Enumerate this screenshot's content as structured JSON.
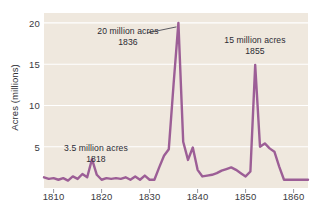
{
  "chart_data": {
    "type": "line",
    "title": "",
    "xlabel": "",
    "ylabel": "Acres (millions)",
    "xlim": [
      1808,
      1863
    ],
    "ylim": [
      0,
      21.2
    ],
    "grid": true,
    "legend": "none",
    "plot_background": "#efe8de",
    "line_color": "#9c5e96",
    "gridline_color": "#ffffff",
    "x_ticks": [
      1810,
      1820,
      1830,
      1840,
      1850,
      1860
    ],
    "x_tick_labels": [
      "1810",
      "1820",
      "1830",
      "1840",
      "1850",
      "1860"
    ],
    "y_ticks": [
      5,
      10,
      15,
      20
    ],
    "y_tick_labels": [
      "5",
      "10",
      "15",
      "20"
    ],
    "series": [
      {
        "name": "Public land sales",
        "x": [
          1808,
          1809,
          1810,
          1811,
          1812,
          1813,
          1814,
          1815,
          1816,
          1817,
          1818,
          1819,
          1820,
          1821,
          1822,
          1823,
          1824,
          1825,
          1826,
          1827,
          1828,
          1829,
          1830,
          1831,
          1832,
          1833,
          1834,
          1835,
          1836,
          1837,
          1838,
          1839,
          1840,
          1841,
          1842,
          1843,
          1844,
          1845,
          1846,
          1847,
          1848,
          1849,
          1850,
          1851,
          1852,
          1853,
          1854,
          1855,
          1856,
          1857,
          1858,
          1859,
          1860,
          1861,
          1862,
          1863
        ],
        "values": [
          1.3,
          1.1,
          1.2,
          1.0,
          1.2,
          0.9,
          1.4,
          1.1,
          1.7,
          1.3,
          3.5,
          1.6,
          1.0,
          1.2,
          1.1,
          1.2,
          1.1,
          1.3,
          1.0,
          1.4,
          1.0,
          1.5,
          1.0,
          1.0,
          2.5,
          3.9,
          4.7,
          12.6,
          20.0,
          5.6,
          3.4,
          4.9,
          2.2,
          1.4,
          1.5,
          1.6,
          1.8,
          2.1,
          2.3,
          2.5,
          2.2,
          1.8,
          1.4,
          2.0,
          14.9,
          5.0,
          5.4,
          4.8,
          4.4,
          2.6,
          1.0,
          1.0,
          1.0,
          1.0,
          1.0,
          1.0
        ]
      }
    ],
    "annotations": [
      {
        "name": "annotation-1818",
        "line1": "3.5 million acres",
        "line2": "1818",
        "target_x": 1818,
        "target_y": 3.5,
        "leader": false
      },
      {
        "name": "annotation-1836",
        "line1": "20 million acres",
        "line2": "1836",
        "target_x": 1836,
        "target_y": 20.0,
        "leader": true
      },
      {
        "name": "annotation-1855",
        "line1": "15 million acres",
        "line2": "1855",
        "target_x": 1855,
        "target_y": 15.0,
        "leader": false
      }
    ]
  }
}
